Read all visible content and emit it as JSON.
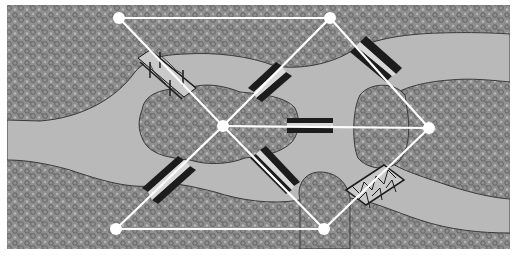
{
  "diagram": {
    "colors": {
      "background": "#ffffff",
      "land": "#8f8f8f",
      "land_speckle_dark": "#5a5a5a",
      "land_speckle_light": "#b8b8b8",
      "river": "#b9b9b9",
      "shore_outline": "#3a3a3a",
      "bridge_dark": "#1c1c1c",
      "bridge_light": "#d8d8d8",
      "graph": "#ffffff"
    },
    "frame": {
      "x": 7,
      "y": 5,
      "width": 503,
      "height": 244
    },
    "nodes": [
      {
        "id": "A",
        "label": "north-bank-west",
        "x": 119,
        "y": 18
      },
      {
        "id": "B",
        "label": "north-bank-east",
        "x": 330,
        "y": 18
      },
      {
        "id": "C",
        "label": "island-kneiphof",
        "x": 223,
        "y": 126
      },
      {
        "id": "D",
        "label": "east-island",
        "x": 429,
        "y": 128
      },
      {
        "id": "E",
        "label": "south-bank-west",
        "x": 116,
        "y": 229
      },
      {
        "id": "F",
        "label": "south-bank-east",
        "x": 324,
        "y": 229
      }
    ],
    "edges": [
      [
        "A",
        "B"
      ],
      [
        "A",
        "C"
      ],
      [
        "B",
        "C"
      ],
      [
        "B",
        "D"
      ],
      [
        "C",
        "D"
      ],
      [
        "C",
        "E"
      ],
      [
        "C",
        "F"
      ],
      [
        "E",
        "F"
      ],
      [
        "F",
        "D"
      ]
    ],
    "bridges": [
      {
        "id": 1,
        "style": "suspension",
        "x1": 145,
        "y1": 52,
        "x2": 190,
        "y2": 93
      },
      {
        "id": 2,
        "style": "solid",
        "x1": 255,
        "y1": 90,
        "x2": 290,
        "y2": 62
      },
      {
        "id": 3,
        "style": "solid",
        "x1": 355,
        "y1": 48,
        "x2": 390,
        "y2": 80
      },
      {
        "id": 4,
        "style": "solid",
        "x1": 290,
        "y1": 122,
        "x2": 330,
        "y2": 122
      },
      {
        "id": 5,
        "style": "solid",
        "x1": 148,
        "y1": 195,
        "x2": 188,
        "y2": 162
      },
      {
        "id": 6,
        "style": "solid",
        "x1": 255,
        "y1": 162,
        "x2": 292,
        "y2": 198
      },
      {
        "id": 7,
        "style": "truss",
        "x1": 352,
        "y1": 198,
        "x2": 398,
        "y2": 170
      }
    ]
  }
}
